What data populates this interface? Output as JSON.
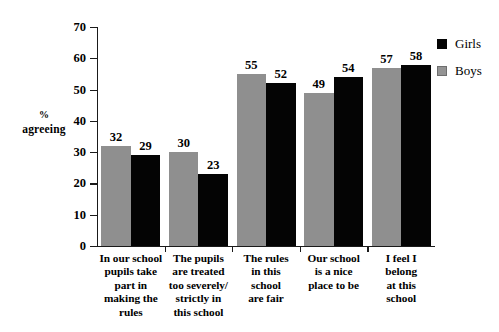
{
  "chart_data": {
    "type": "bar",
    "title": "",
    "xlabel": "",
    "ylabel": "% agreeing",
    "ylabel_line1": "%",
    "ylabel_line2": "agreeing",
    "ylim": [
      0,
      70
    ],
    "yticks": [
      0,
      10,
      20,
      30,
      40,
      50,
      60,
      70
    ],
    "ytick_labels": [
      "0",
      "10",
      "20",
      "30",
      "40",
      "50",
      "60",
      "70"
    ],
    "grid": false,
    "legend_position": "top-right",
    "categories": [
      "In our school pupils take part in making the rules",
      "The pupils are treated too severely/ strictly in this school",
      "The rules in this school are fair",
      "Our school is a nice place to be",
      "I feel I belong at this school"
    ],
    "category_lines": [
      [
        "In our school",
        "pupils take",
        "part in",
        "making the",
        "rules"
      ],
      [
        "The pupils",
        "are treated",
        "too severely/",
        "strictly in",
        "this school"
      ],
      [
        "The rules",
        "in this",
        "school",
        "are fair"
      ],
      [
        "Our school",
        "is a nice",
        "place to be"
      ],
      [
        "I feel I",
        "belong",
        "at this",
        "school"
      ]
    ],
    "series": [
      {
        "name": "Boys",
        "color": "#8f8f8f",
        "order_in_group": 1,
        "values": [
          32,
          30,
          55,
          49,
          57
        ],
        "value_labels": [
          "32",
          "30",
          "55",
          "49",
          "57"
        ]
      },
      {
        "name": "Girls",
        "color": "#040404",
        "order_in_group": 2,
        "values": [
          29,
          23,
          52,
          54,
          58
        ],
        "value_labels": [
          "29",
          "23",
          "52",
          "54",
          "58"
        ]
      }
    ]
  },
  "legend": {
    "entries": [
      {
        "label": "Girls",
        "swatch": "black"
      },
      {
        "label": "Boys",
        "swatch": "gray"
      }
    ]
  }
}
